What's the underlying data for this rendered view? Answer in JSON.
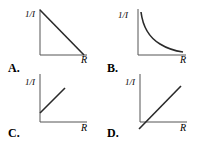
{
  "panels": [
    {
      "label": "A.",
      "y_axis": "1/I",
      "x_axis": "R",
      "curve": "straight line decreasing from y-intercept to x-intercept"
    },
    {
      "label": "B.",
      "y_axis": "1/I",
      "x_axis": "R",
      "curve": "decreasing hyperbola-like curve"
    },
    {
      "label": "C.",
      "y_axis": "1/I",
      "x_axis": "R",
      "curve": "straight line increasing with positive y-intercept"
    },
    {
      "label": "D.",
      "y_axis": "1/I",
      "x_axis": "R",
      "curve": "straight line increasing with negative y-intercept"
    }
  ],
  "colors": {
    "ink": "#2a2a2a",
    "axes": "#555555",
    "background": "#ffffff"
  }
}
